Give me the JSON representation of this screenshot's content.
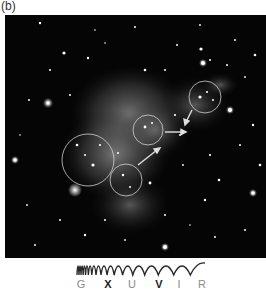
{
  "figure": {
    "panel_label": "(b)",
    "image_description": "Composite astronomical image of a galaxy cluster with diffuse glow, four circled regions and three arrows",
    "circles": [
      {
        "cx": 200,
        "cy": 82,
        "r": 16
      },
      {
        "cx": 143,
        "cy": 115,
        "r": 15
      },
      {
        "cx": 83,
        "cy": 145,
        "r": 26
      },
      {
        "cx": 121,
        "cy": 165,
        "r": 16
      }
    ],
    "arrows": [
      {
        "x1": 187,
        "y1": 95,
        "x2": 181,
        "y2": 107
      },
      {
        "x1": 160,
        "y1": 117,
        "x2": 178,
        "y2": 117
      },
      {
        "x1": 133,
        "y1": 150,
        "x2": 152,
        "y2": 135
      }
    ]
  },
  "spectrum": {
    "bands": [
      {
        "label": "G",
        "highlighted": false
      },
      {
        "label": "X",
        "highlighted": true
      },
      {
        "label": "U",
        "highlighted": false
      },
      {
        "label": "V",
        "highlighted": true
      },
      {
        "label": "I",
        "highlighted": false
      },
      {
        "label": "R",
        "highlighted": false
      }
    ]
  },
  "colors": {
    "background": "#ffffff",
    "sky": "#050505",
    "glow": "#bdbdbd",
    "annotation": "#d8d8d8",
    "wave": "#2a2a2a",
    "band_text": "#8a8a8a",
    "band_text_highlight": "#222222"
  }
}
